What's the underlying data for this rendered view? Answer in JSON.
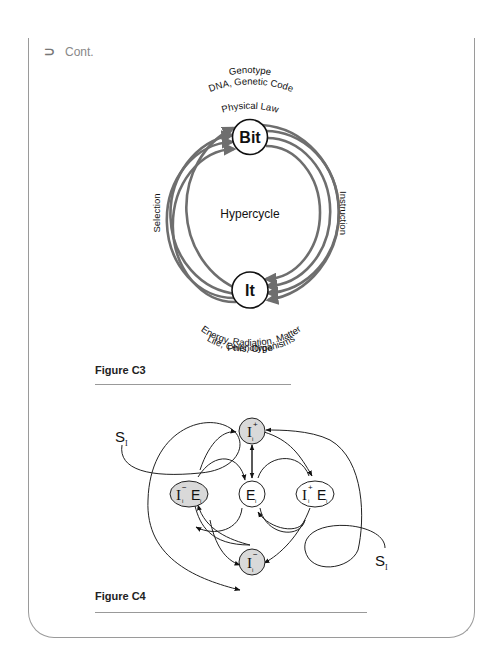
{
  "header": {
    "icon": "return-arrow-icon",
    "icon_glyph": "⊃",
    "label": "Cont."
  },
  "figure_c3": {
    "caption": "Figure C3",
    "top_labels": [
      "Genotype",
      "DNA, Genetic Code",
      "Physical Law"
    ],
    "bit_node": "Bit",
    "center_label": "Hypercycle",
    "left_label": "Selection",
    "right_label": "Instruction",
    "it_node": "It",
    "bottom_labels": [
      "Energy, Radiation, Matter",
      "Life, Cells, Organisms",
      "Phenotype"
    ],
    "ring_color": "#6e6e6e"
  },
  "figure_c4": {
    "caption": "Figure C4",
    "nodes": {
      "top": {
        "main": "I",
        "sub": "i",
        "sup": "+"
      },
      "left": {
        "main": "I",
        "sub": "i",
        "sup": "−",
        "suffix": "E",
        "suffix_sub": "i"
      },
      "center": {
        "main": "E",
        "sub": "i"
      },
      "right": {
        "main": "I",
        "sub": "i",
        "sup": "+",
        "suffix": "E",
        "suffix_sub": "i"
      },
      "bottom": {
        "main": "I",
        "sub": "i",
        "sup": "−"
      }
    },
    "source_left": {
      "main": "S",
      "sub": "I"
    },
    "source_right": {
      "main": "S",
      "sub": "I"
    },
    "node_fill_shaded": "#d9d9d9",
    "node_fill_plain": "#ffffff"
  }
}
